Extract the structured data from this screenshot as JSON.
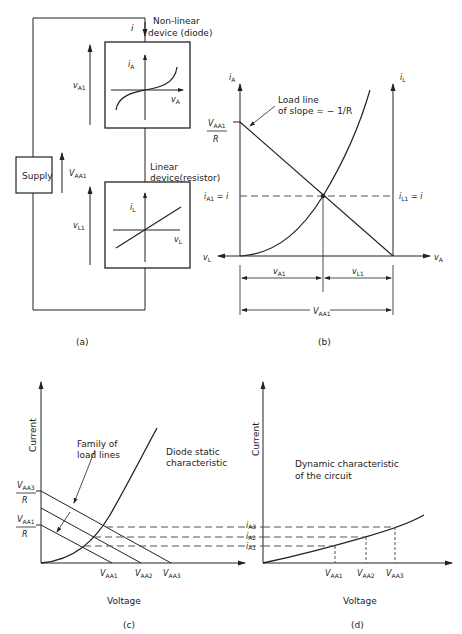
{
  "panel_a": {
    "caption": "(a)",
    "diode_label_line1": "Non-linear",
    "diode_label_line2": "device (diode)",
    "current_label": "i",
    "diode_axes": {
      "y": "i",
      "y_sub": "A",
      "x": "v",
      "x_sub": "A"
    },
    "resistor_label_line1": "Linear",
    "resistor_label_line2": "device(resistor)",
    "resistor_axes": {
      "y": "i",
      "y_sub": "L",
      "x": "v",
      "x_sub": "L"
    },
    "supply_label": "Supply",
    "v_a1": {
      "main": "v",
      "sub": "A1"
    },
    "v_aa1": {
      "main": "V",
      "sub": "AA1"
    },
    "v_l1": {
      "main": "v",
      "sub": "L1"
    }
  },
  "panel_b": {
    "caption": "(b)",
    "left_axis": {
      "main": "i",
      "sub": "A"
    },
    "right_axis": {
      "main": "i",
      "sub": "L"
    },
    "load_line_line1": "Load line",
    "load_line_line2": "of slope = − 1/R",
    "intercept_num": {
      "main": "V",
      "sub": "AA1"
    },
    "intercept_den": "R",
    "left_op": {
      "main": "i",
      "sub": "A1",
      "rest": " = i"
    },
    "right_op": {
      "main": "i",
      "sub": "L1",
      "rest": " = i"
    },
    "x_left": {
      "main": "v",
      "sub": "L"
    },
    "x_right": {
      "main": "v",
      "sub": "A"
    },
    "dim_va1": {
      "main": "v",
      "sub": "A1"
    },
    "dim_vl1": {
      "main": "v",
      "sub": "L1"
    },
    "dim_vaa1": {
      "main": "V",
      "sub": "AA1"
    }
  },
  "panel_c": {
    "caption": "(c)",
    "y_label": "Current",
    "x_label": "Voltage",
    "family_line1": "Family of",
    "family_line2": "load lines",
    "diode_line1": "Diode static",
    "diode_line2": "characteristic",
    "top_num": {
      "main": "V",
      "sub": "AA3"
    },
    "top_den": "R",
    "bot_num": {
      "main": "V",
      "sub": "AA1"
    },
    "bot_den": "R",
    "x_ticks": [
      {
        "main": "V",
        "sub": "AA1"
      },
      {
        "main": "V",
        "sub": "AA2"
      },
      {
        "main": "V",
        "sub": "AA3"
      }
    ]
  },
  "panel_d": {
    "caption": "(d)",
    "y_label": "Current",
    "x_label": "Voltage",
    "dyn_line1": "Dynamic characteristic",
    "dyn_line2": "of the circuit",
    "y_ticks": [
      {
        "main": "i",
        "sub": "A3"
      },
      {
        "main": "i",
        "sub": "A2"
      },
      {
        "main": "i",
        "sub": "A1"
      }
    ],
    "x_ticks": [
      {
        "main": "V",
        "sub": "AA1"
      },
      {
        "main": "V",
        "sub": "AA2"
      },
      {
        "main": "V",
        "sub": "AA3"
      }
    ]
  },
  "colors": {
    "ink": "#222222",
    "paper": "#ffffff",
    "dash": "#555555"
  }
}
